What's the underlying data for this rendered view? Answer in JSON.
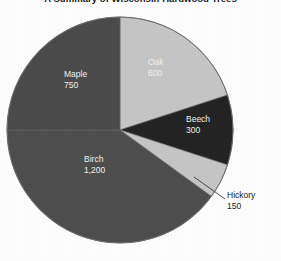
{
  "chart_data": {
    "type": "pie",
    "title": "A Summary of Wisconsin Hardwood Trees",
    "categories": [
      "Oak",
      "Beech",
      "Hickory",
      "Birch",
      "Maple"
    ],
    "values": [
      600,
      300,
      150,
      1200,
      750
    ],
    "value_labels": [
      "600",
      "300",
      "150",
      "1,200",
      "750"
    ],
    "total": 3000,
    "start_angle_deg": 0,
    "direction": "clockwise",
    "slice_colors": [
      "#c6c6c6",
      "#242424",
      "#c6c6c6",
      "#4e4e4e",
      "#4b4b4b"
    ],
    "slice_label_colors": [
      "#f2f2f2",
      "#f2f2f2",
      "#1b1b1b",
      "#f2f2f2",
      "#f2f2f2"
    ],
    "slice_label_placement": [
      "inside",
      "inside",
      "outside-callout",
      "inside",
      "inside"
    ],
    "legend": "none",
    "grid": false,
    "xlabel": "",
    "ylabel": ""
  },
  "figure": {
    "background_color": "#fefefe",
    "outline_color": "#6d6d6d"
  },
  "labels": {
    "oak": {
      "name": "Oak",
      "value": "600"
    },
    "beech": {
      "name": "Beech",
      "value": "300"
    },
    "hickory": {
      "name": "Hickory",
      "value": "150"
    },
    "birch": {
      "name": "Birch",
      "value": "1,200"
    },
    "maple": {
      "name": "Maple",
      "value": "750"
    }
  },
  "callout": {
    "hickory_leader": "leader-line"
  }
}
